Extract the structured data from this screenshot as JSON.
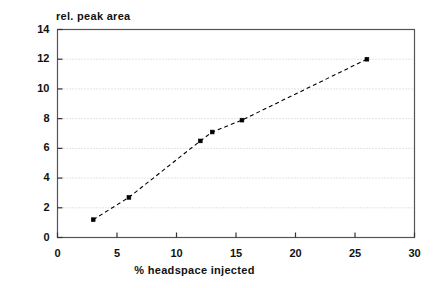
{
  "chart_data": {
    "type": "scatter",
    "title": "",
    "ylabel": "rel. peak area",
    "xlabel": "% headspace injected",
    "xlim": [
      0,
      30
    ],
    "ylim": [
      0,
      14
    ],
    "xticks": [
      0,
      5,
      10,
      15,
      20,
      25,
      30
    ],
    "xtick_labels": [
      "0",
      "5",
      "10",
      "15",
      "20",
      "25",
      "30"
    ],
    "yticks": [
      0,
      2,
      4,
      6,
      8,
      10,
      12,
      14
    ],
    "ytick_labels": [
      "0",
      "2",
      "4",
      "6",
      "8",
      "10",
      "12",
      "14"
    ],
    "grid": "horizontal-dotted",
    "legend": "none",
    "series": [
      {
        "name": "rel. peak area",
        "marker": "filled-square",
        "linestyle": "dashed",
        "color": "#000000",
        "x": [
          3.0,
          6.0,
          12.0,
          13.0,
          15.5,
          26.0
        ],
        "y": [
          1.2,
          2.7,
          6.5,
          7.1,
          7.9,
          12.0
        ],
        "points": [
          {
            "x": 3.0,
            "y": 1.2
          },
          {
            "x": 6.0,
            "y": 2.7
          },
          {
            "x": 12.0,
            "y": 6.5
          },
          {
            "x": 13.0,
            "y": 7.1
          },
          {
            "x": 15.5,
            "y": 7.9
          },
          {
            "x": 26.0,
            "y": 12.0
          }
        ]
      }
    ]
  },
  "axes": {
    "frame_color": "#555555",
    "grid_color": "#c8c8c8"
  }
}
